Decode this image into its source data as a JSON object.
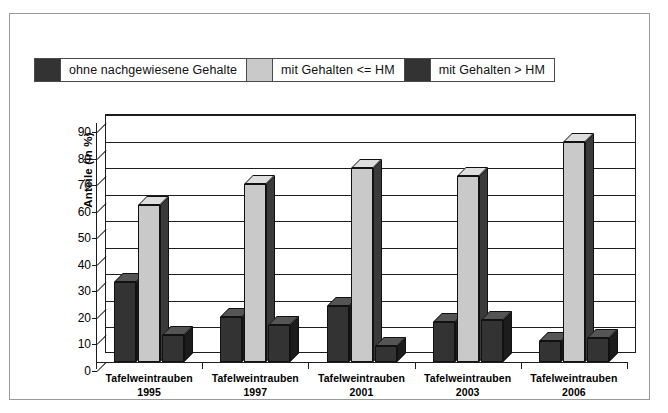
{
  "figure": {
    "y_axis_title": "Anteile (in %)"
  },
  "legend": {
    "items": [
      {
        "label": "ohne nachgewiesene Gehalte",
        "color": "#333333",
        "icon": "legend-swatch-icon"
      },
      {
        "label": "mit Gehalten <= HM",
        "color": "#c9c9c9",
        "icon": "legend-swatch-icon"
      },
      {
        "label": "mit Gehalten > HM",
        "color": "#333333",
        "icon": "legend-swatch-icon"
      }
    ]
  },
  "chart_data": {
    "type": "bar",
    "title": "",
    "xlabel": "",
    "ylabel": "Anteile (in %)",
    "ylim": [
      0,
      90
    ],
    "ytick_step": 10,
    "yticks": [
      0,
      10,
      20,
      30,
      40,
      50,
      60,
      70,
      80,
      90
    ],
    "grid": true,
    "legend_position": "top",
    "categories": [
      "Tafelweintrauben 1995",
      "Tafelweintrauben 1997",
      "Tafelweintrauben 2001",
      "Tafelweintrauben 2003",
      "Tafelweintrauben 2006"
    ],
    "category_lines": [
      [
        "Tafelweintrauben",
        "1995"
      ],
      [
        "Tafelweintrauben",
        "1997"
      ],
      [
        "Tafelweintrauben",
        "2001"
      ],
      [
        "Tafelweintrauben",
        "2003"
      ],
      [
        "Tafelweintrauben",
        "2006"
      ]
    ],
    "series": [
      {
        "name": "ohne nachgewiesene Gehalte",
        "color": "#333333",
        "values": [
          30,
          17,
          21,
          15,
          8
        ]
      },
      {
        "name": "mit Gehalten <= HM",
        "color": "#c9c9c9",
        "values": [
          59,
          67,
          73,
          70,
          83
        ]
      },
      {
        "name": "mit Gehalten > HM",
        "color": "#333333",
        "values": [
          10,
          14,
          6,
          16,
          9
        ]
      }
    ]
  }
}
